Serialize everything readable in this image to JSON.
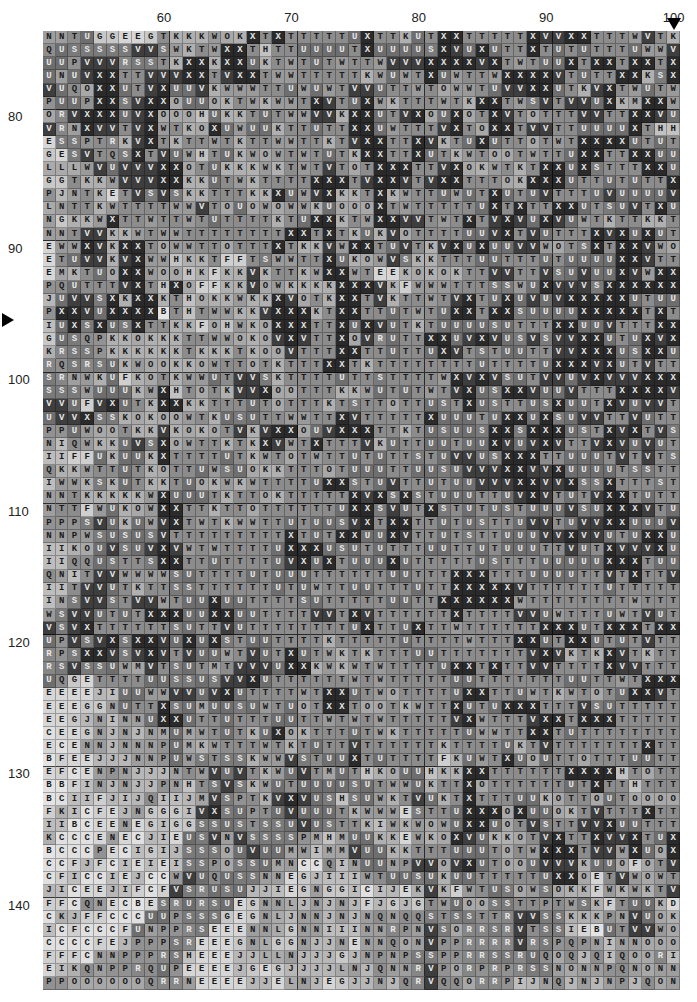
{
  "chart_data": {
    "type": "heatmap",
    "title": "",
    "xlabel": "",
    "ylabel": "",
    "x_range": [
      51,
      100
    ],
    "y_range": [
      74,
      146
    ],
    "x_ticks": [
      60,
      70,
      80,
      90,
      100
    ],
    "y_ticks": [
      80,
      90,
      100,
      110,
      120,
      130,
      140
    ],
    "grid": true,
    "major_grid_every": 10,
    "markers": {
      "row_marker": {
        "row": 96,
        "shape": "right-pointing-triangle",
        "side": "left"
      },
      "col_marker": {
        "col": 100,
        "shape": "down-pointing-triangle",
        "side": "top"
      }
    },
    "legend": "letter-coded grayscale; later letters in alphabet rendered darker",
    "letter_shades": {
      "B": "#e4e4e4",
      "C": "#e0e0e0",
      "D": "#dadada",
      "E": "#d6d6d6",
      "F": "#cfcfcf",
      "G": "#c8c8c8",
      "H": "#c2c2c2",
      "I": "#bdbdbd",
      "J": "#b7b7b7",
      "K": "#b0b0b0",
      "L": "#aaaaaa",
      "M": "#a4a4a4",
      "N": "#9e9e9e",
      "O": "#a8a8a8",
      "P": "#929292",
      "Q": "#8e8e8e",
      "R": "#868686",
      "S": "#7a7a7a",
      "T": "#8c8c8c",
      "U": "#6e6e6e",
      "V": "#3e3e3e",
      "W": "#9a9a9a",
      "X": "#2a2a2a"
    },
    "light_text_letters": [
      "R",
      "S",
      "U",
      "V",
      "X"
    ],
    "rows": [
      "NNTUGGEEGTKKKWOKXTXTTTTTUXTTKUTXXTTTTTXVVXXTTTWVTK",
      "QUSSSSSVVSWKTWXXTHTTUUUUTXUUUUSXVUXUTTXTUTUTTTUWWV",
      "UUPVVVRSSTKXXKXXUKTWTUTWTTWVVVXXXXVXTWTUUXTXXTXXTXX",
      "UNUVXXTTVVVXXTVXXTWWTTTTTKWUWTXUWTTWXXXXVTUTTXXKSX",
      "VUQOXXUTVXUUVKWWWTTUWUWTVVUTTWTOWWTUVVXXUTKVXTWUTW",
      "PUUPXXSVXXOUUOKTWKWWTXVTUXWKTTTWTKXXTWSVTVVUXKMXXW",
      "ORVXXXUVXOOOHUKKTUTWWVVKXXUTVXOUXOTXVTOTTTVVTTXXVUW",
      "VRNXVVTVXWTKOXUWUUKTTUTTXXUWTTTVXTOXXTVVTTUUUUXTHH",
      "ESSPTRKVXTKTTWTKTTWWTTKTVXXTTXVKTUXUTTOTWTXXXXUTUT",
      "GESVTQSXTVUWHTUKWOWTWTUTKXXTTXUTKWTOOTWTTUXXTTXXUU",
      "LLLWVUVVVXXOTUKKKWKTWTVTOTXXXTTVXOKWTKTXXUXSTTTXXU",
      "GGTKKWVVVXXKKUTWKTTTTXXXTVXXVTVXXTTTOKXXXUTTUTUTTX",
      "PJNTKETVSVSKKTTTKKXUWVXKKTXKWTTUWUTXUTUVTTTUVUUUUVT",
      "LNTTKWTTTTWWVTOUOWOWWKUOOOXTWTTTTTUXTXTTXXUTSUVTXUS",
      "NGKKWXTTWTTWTUTTTTKTUXXKTWXXVVTWTXTVXVUXVUWTKTTKKT",
      "NNTVVKKWTWWTTTTTTTTXXTXTKUKVOTTTTUUVXTVUTTTXVXUXUTO",
      "EWWXVKXXTOWWTTOTTTXTKKVWXXTUVTKVXUXUUVVWOTSXTXXVWO",
      "ETUVVKVXWWHKKTFFTSWWTTXUKOWVSKKTTTUUTTTUTUUUUXXVTTX",
      "EMKTUOXXWOOHKFKKVKTTKWXXWTEEKOKOKTTVVTTVSUVUUXVWXX",
      "PQUTTTVXTHXOFFKKVOWKKKKXXXVKFWWWTTTSSWUXVVVSXXXXXX",
      "JUVVSXKXXKTHOKKWKKXVOTKXXTVKTTWTVXTUXUVUVXXXXXUTUU",
      "PXXVUXXXXBTHTWWKKVXXXKTXXTTUTWTUXXTXXSUUUUXXXXXTX",
      "IUXSXUSXTTKKFOHWKOXXXTTXUXVUTKTUUUUSUTTTXXUUVTTTXXVX",
      "GUSQPKKOKKKTTWWOKOVXVTTXOVRUTTXXUVXVUSVSVVXXUTUXVX",
      "KRSSPKKKKKKTKKKTKOOVTTTXXTTUTTUXVTSTUUTTVVXXXUSXXU",
      "RQSRSUKWOOKKOWTTOTKTTTXXTKTTTTTTTTUTTTTUXXXVXUTV",
      "SRNWKUFKOTKWWUTVVSKTTTTUTTSTTTTWXVXVSUTVVUVXVVVXXXT",
      "SSSWUUUKWXHTOTKVVXOOTTTKKWUTUTWTVXUSXXVUUVTTTXXXXV",
      "VVUFVXUTKXXKKTTTUTOTTTKTSTTOTTUSTXUSTTUSXUUTXVUVV",
      "UVVXSSKOKOOWTKUSUTTWWTTXVTTTTTXUUUTUXXUXSUVVTTVU",
      "PPUWOOTKKVKOKOTVKVXXOUVXXXTTKTUSUUSXXSXXXUSTXVXTVS",
      "NIQWKKUVSXOWTTKTKXVWTXTTTVKUTTUUTUUXVUVXVTTVXVUVUT",
      "IIFFUKUUKXTTTTUTKWTOTWTTUTUTTSTUVVUSXXXTTUUUTVTVTS",
      "QKKWTTUTKOTTUWSUOKKTTTOTUUUTTUUSUVVVXXVVXUUUUTSSTT",
      "IWWKSKUTKKTUOKWKWTTTTUXXSTUVTTUTUUVVVXXVVXSSXTTTSTT",
      "NNTKKKKKWXUUUTKTTOKTTTTTXVXSXSTUUUTTUVXVTUTVXXTUTTX",
      "NTTFWUKOWXXTTKTTOTTTTTTUXXSVUTXSTUTUSTUUUVSUXXXVTUV",
      "PPPSVUKUWVXTWTKWWTTUTUUSVXTXXTTUTUSTTUVVTUVVXXUUUV",
      "NNPWSUSUSVTTTTTTTTTXTUTXXUUXVTTUTSTTUUUVVXVVUTUXXU",
      "IIKOUVSUVXVWTWTTTTUXXXUSUTUTTTUUTTUTUUUTTVUTXVVVXUS",
      "IIQQUSTTSXXTTUTTTTUVXUXTUUUXUTTTTTUSTTTUUUUUXXXTUUT",
      "QNITVVWWWWSUTTTTUTUUUTTTTTTUUTTTXXXTTTUUUUTTVTXTTVV",
      "IITVVUTKTTSSTTTTTTUTUWTTUUTTTUTTXXXXXVTTTTTTUTTTTTTUU",
      "INSVVSTVVWTUUXUUTTTTSUTTTTTUUTTXXXXXXWTTTTTTTTWTTTUUU",
      "WSVVUTUTXXXUUXXUUTTTTVVTXVTTTTTTXTTTTVVUWTTTUWTVU",
      "VSVXTTTTTTSUTTVUTTTTTTTTUXTTUXTTWTTTTTTXXXUTXXXTXXX",
      "UPVSVXSXXVUXUXSTUUTTTTKTTTTTUTTTTWTTTXXUTXXUTUTVT",
      "RPSXXVSVXVTVUUWTVUTXUTWKTKTTTUUTTTTTTTVXVKTKXVTKTTT",
      "RSVSSUWMVTSUTMTVVVUXXKWKWTWTTTTUXXTXTTVVTTTTXVVTT",
      "UQGETTTTUUSSUSVVXUTTTTTTWTWTTTTTUUTTTTTTTUUTTWTXXXVTTT",
      "EEEEJIUUWWVVUVXUTTTTWTXXUTWOTTTTUXXTTUWTKWTOTUXXVTTT",
      "EEEGGNUTTXSUMUUSUWTUOTXXTOOTKWTTXUTUXXXTTTVSUTTTT",
      "EEGJNINNUXXUTTUTTTUUTTWTWTWTTTTTVXWTTTVXXTXXXTTT",
      "CEEGNJNJNMUMWTUTKUXOKTTTUTWKTTTTTUWWTTXXTUTTTT",
      "ECENNJNNNPUMKWTTTWTKTUTTVTTTTTTKTTTTUKTVTTTTTTTX",
      "BFEEJJJNNPUWSTSSKWWVSTUUXTUTTTTFKUWTXUOUTTOTTTUU",
      "EFCENPNJJJNTWVUVTKWUVTMUTHKOUUHKKXXTTTTTTXXXXHTO",
      "BBFINJNJJPNHTSVSKWUTUUUUSUTWWUKTTXOTTTTTTUTXTTHT",
      "BCIIFJIJQIIJMVSPTKVXVUSHSUWKTVUKTXTTTUUKOTTOUTOOOO",
      "FKICFEJNGGGIVXSUPTUVUUUTKWWWESTTUXXXOXUUOKTVTTTXTT",
      "IIBCEENEGIGGSSUSTSSUVUSTTKIWKWOWUXXUOTVSTTVVXUUTTT",
      "KCCCENECJIEUSVNVSSSSPMHMUUKKEWKOXVUKKOTVXTTXVVXTUX",
      "BCCCPECIGIJSSSOUVUUMWIMMVUUKKTTTUUUTOTWXXXTVVWXUOX",
      "CCFJFCIEIEISSPOSSUMNCCQINUUNPVVOVXUTOOUVVVKUUOFOTV",
      "CFICCIEJCCWVUQUSSNNEGJIIIWTUUSUKUUTTTTTUXXOETVWOWTV",
      "JICEEJIFCFVSRUSUJJIEGNGGICIJEKVKFWTUSOWSOKKFWKWKTV",
      "FFCQNECBESRURSUEGNNLJNJNJFJGJGTWUOOSSTTPTWSKFTUUKD",
      "CKJFFCCCUUPSSSGEGNLJNNJNJNQNQQSTSSTTRVVSSKKKPNVUOK",
      "ICFCCCFUNPPRSEEENNLGNNIIINNRPNVSORRSRVTSSIEBUTVVWO",
      "CCCCFEJPPPSREEEGNLGGNJJNENNQONVPPRRRRVRSPQPNINNOOO",
      "FFFCNNPPPRSHEEEJJLLNJJJGJNPNPSSPPRRSSRUQOQJQIQOORI",
      "EIKQNPPRQUPEEEEJGEGJJJJLNJQNNRVPORPRPRSSNONNPQNONNIN",
      "PPOOOOOOQRRNEEEEJJELNJEGJJNJQRVQQORRPIJNQJNJNPJQON"
    ]
  }
}
